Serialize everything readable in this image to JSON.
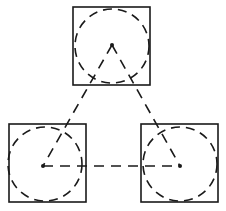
{
  "diagram": {
    "stroke_color": "#1a1a1a",
    "background": "#ffffff",
    "nodes": [
      {
        "id": "top",
        "square": {
          "x": 73,
          "y": 7,
          "size": 77
        },
        "center": {
          "x": 112,
          "y": 45
        },
        "radius": 36
      },
      {
        "id": "bottom-left",
        "square": {
          "x": 9,
          "y": 124,
          "size": 77
        },
        "center": {
          "x": 43,
          "y": 166
        },
        "radius": 37
      },
      {
        "id": "bottom-right",
        "square": {
          "x": 141,
          "y": 124,
          "size": 77
        },
        "center": {
          "x": 180,
          "y": 166
        },
        "radius": 37
      }
    ],
    "edges": [
      {
        "from": "top",
        "to": "bottom-left",
        "style": "dashed"
      },
      {
        "from": "top",
        "to": "bottom-right",
        "style": "dashed"
      },
      {
        "from": "bottom-left",
        "to": "bottom-right",
        "style": "dashed"
      }
    ]
  }
}
